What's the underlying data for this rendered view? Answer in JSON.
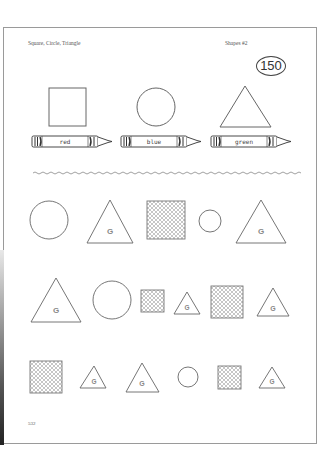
{
  "header": {
    "title": "Square, Circle, Triangle",
    "worksheet": "Shapes #2",
    "page_badge": "150"
  },
  "footer": {
    "page_number": "532"
  },
  "colors": {
    "line": "#666666",
    "hatch": "#999999",
    "g_letter": "#888888",
    "page_border": "#9a9a9a"
  },
  "key": [
    {
      "shape": "square",
      "crayon_label": "red"
    },
    {
      "shape": "circle",
      "crayon_label": "blue"
    },
    {
      "shape": "triangle",
      "crayon_label": "green"
    }
  ],
  "triangle_letter": "G",
  "rows": [
    [
      "circle",
      "triangle-G",
      "hatched-square",
      "small-circle",
      "triangle-G"
    ],
    [
      "triangle-G",
      "circle",
      "hatched-square",
      "small-triangle-G",
      "hatched-square",
      "triangle-G"
    ],
    [
      "hatched-square",
      "small-triangle-G",
      "triangle-G",
      "small-circle",
      "hatched-square",
      "small-triangle-G"
    ]
  ]
}
